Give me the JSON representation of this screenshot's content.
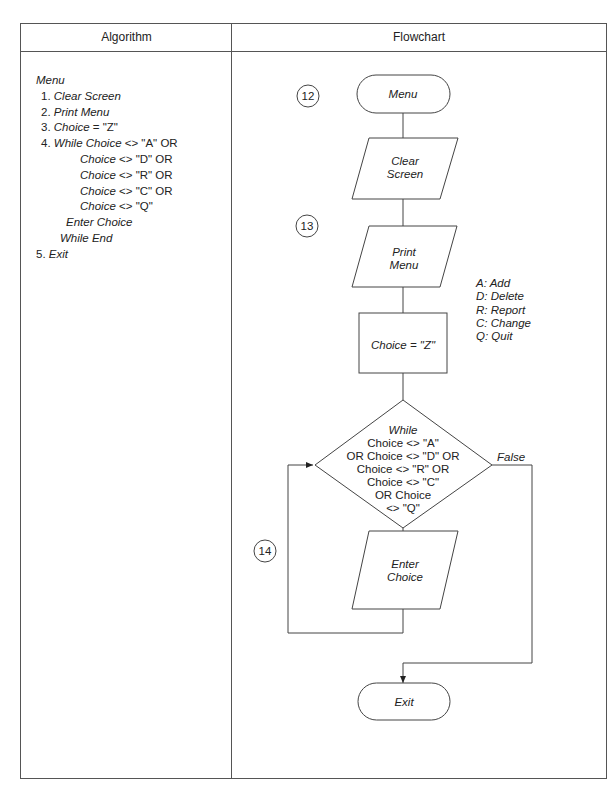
{
  "table": {
    "headers": {
      "algorithm": "Algorithm",
      "flowchart": "Flowchart"
    }
  },
  "algorithm": {
    "title": "Menu",
    "lines": [
      {
        "num": "1. ",
        "text": "Clear Screen"
      },
      {
        "num": "2. ",
        "text": "Print Menu"
      },
      {
        "num": "3. ",
        "text": "Choice",
        "rest": " = \"Z\""
      },
      {
        "num": "4. ",
        "text": "While Choice",
        "rest": " <> \"A\" OR"
      },
      {
        "text": "Choice",
        "rest": " <> \"D\" OR"
      },
      {
        "text": "Choice",
        "rest": " <> \"R\" OR"
      },
      {
        "text": "Choice",
        "rest": " <> \"C\" OR"
      },
      {
        "text": "Choice",
        "rest": " <> \"Q\""
      },
      {
        "text": "Enter Choice"
      },
      {
        "text": "While End"
      },
      {
        "num": "5. ",
        "text": "Exit"
      }
    ]
  },
  "flowchart": {
    "connectors": [
      "12",
      "13",
      "14"
    ],
    "start": "Menu",
    "clear_screen": [
      "Clear",
      "Screen"
    ],
    "print_menu": [
      "Print",
      "Menu"
    ],
    "assign": "Choice = \"Z\"",
    "decision": [
      "While",
      "Choice <> \"A\"",
      "OR Choice <> \"D\" OR",
      "Choice <> \"R\" OR",
      "Choice <> \"C\"",
      "OR Choice",
      "<> \"Q\""
    ],
    "true_label": "True",
    "false_label": "False",
    "enter_choice": [
      "Enter",
      "Choice"
    ],
    "end": "Exit",
    "legend": [
      "A: Add",
      "D: Delete",
      "R: Report",
      "C: Change",
      "Q: Quit"
    ]
  }
}
